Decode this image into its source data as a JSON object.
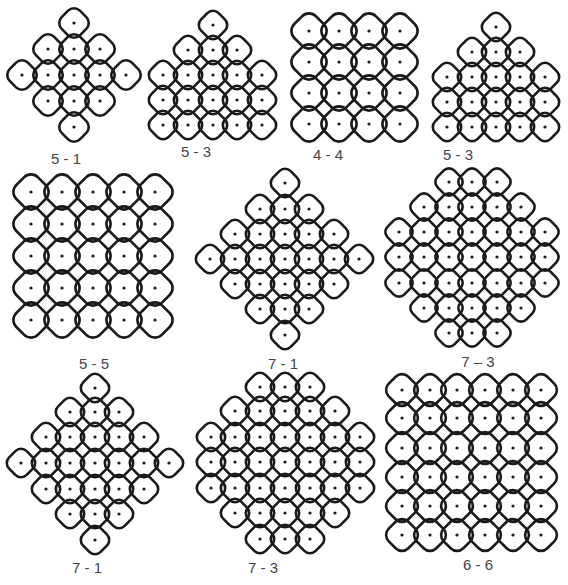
{
  "figure": {
    "background": "#ffffff",
    "stroke_color": "#1a1a1a",
    "dot_color": "#1a1a1a",
    "label_color": "#444444",
    "kolams": [
      {
        "id": "k1",
        "label": "5 - 1",
        "label_pos": [
          66,
          150
        ],
        "spacing": 26,
        "dots": [
          [
            74,
            23
          ],
          [
            48,
            49
          ],
          [
            74,
            49
          ],
          [
            100,
            49
          ],
          [
            22,
            75
          ],
          [
            48,
            75
          ],
          [
            74,
            75
          ],
          [
            100,
            75
          ],
          [
            126,
            75
          ],
          [
            48,
            101
          ],
          [
            74,
            101
          ],
          [
            100,
            101
          ],
          [
            74,
            127
          ]
        ]
      },
      {
        "id": "k2",
        "label": "5 - 3",
        "label_pos": [
          196,
          143
        ],
        "spacing": 25,
        "dots": [
          [
            213,
            25
          ],
          [
            188,
            50
          ],
          [
            213,
            50
          ],
          [
            237,
            50
          ],
          [
            163,
            75
          ],
          [
            188,
            75
          ],
          [
            213,
            75
          ],
          [
            237,
            75
          ],
          [
            262,
            75
          ],
          [
            163,
            100
          ],
          [
            188,
            100
          ],
          [
            213,
            100
          ],
          [
            237,
            100
          ],
          [
            262,
            100
          ],
          [
            163,
            125
          ],
          [
            188,
            125
          ],
          [
            213,
            125
          ],
          [
            237,
            125
          ],
          [
            262,
            125
          ]
        ]
      },
      {
        "id": "k3",
        "label": "4 - 4",
        "label_pos": [
          328,
          146
        ],
        "spacing": 31,
        "dots": [
          [
            309,
            31
          ],
          [
            339,
            31
          ],
          [
            369,
            31
          ],
          [
            400,
            31
          ],
          [
            309,
            62
          ],
          [
            339,
            62
          ],
          [
            369,
            62
          ],
          [
            400,
            62
          ],
          [
            309,
            93
          ],
          [
            339,
            93
          ],
          [
            369,
            93
          ],
          [
            400,
            93
          ],
          [
            309,
            124
          ],
          [
            339,
            124
          ],
          [
            369,
            124
          ],
          [
            400,
            124
          ]
        ]
      },
      {
        "id": "k4",
        "label": "5 - 3",
        "label_pos": [
          458,
          146
        ],
        "spacing": 25,
        "dots": [
          [
            496,
            27
          ],
          [
            472,
            52
          ],
          [
            496,
            52
          ],
          [
            520,
            52
          ],
          [
            447,
            77
          ],
          [
            472,
            77
          ],
          [
            496,
            77
          ],
          [
            520,
            77
          ],
          [
            545,
            77
          ],
          [
            447,
            102
          ],
          [
            472,
            102
          ],
          [
            496,
            102
          ],
          [
            520,
            102
          ],
          [
            545,
            102
          ],
          [
            447,
            127
          ],
          [
            472,
            127
          ],
          [
            496,
            127
          ],
          [
            520,
            127
          ],
          [
            545,
            127
          ]
        ]
      },
      {
        "id": "k5",
        "label": "5 - 5",
        "label_pos": [
          94,
          355
        ],
        "spacing": 31,
        "dots": [
          [
            31,
            192
          ],
          [
            62,
            192
          ],
          [
            93,
            192
          ],
          [
            124,
            192
          ],
          [
            155,
            192
          ],
          [
            31,
            224
          ],
          [
            62,
            224
          ],
          [
            93,
            224
          ],
          [
            124,
            224
          ],
          [
            155,
            224
          ],
          [
            31,
            256
          ],
          [
            62,
            256
          ],
          [
            93,
            256
          ],
          [
            124,
            256
          ],
          [
            155,
            256
          ],
          [
            31,
            288
          ],
          [
            62,
            288
          ],
          [
            93,
            288
          ],
          [
            124,
            288
          ],
          [
            155,
            288
          ],
          [
            31,
            320
          ],
          [
            62,
            320
          ],
          [
            93,
            320
          ],
          [
            124,
            320
          ],
          [
            155,
            320
          ]
        ]
      },
      {
        "id": "k6",
        "label": "7 - 1",
        "label_pos": [
          283,
          355
        ],
        "spacing": 25,
        "dots": [
          [
            285,
            183
          ],
          [
            260,
            209
          ],
          [
            285,
            209
          ],
          [
            309,
            209
          ],
          [
            235,
            234
          ],
          [
            260,
            234
          ],
          [
            285,
            234
          ],
          [
            309,
            234
          ],
          [
            334,
            234
          ],
          [
            210,
            259
          ],
          [
            235,
            259
          ],
          [
            260,
            259
          ],
          [
            285,
            259
          ],
          [
            309,
            259
          ],
          [
            334,
            259
          ],
          [
            359,
            259
          ],
          [
            235,
            284
          ],
          [
            260,
            284
          ],
          [
            285,
            284
          ],
          [
            309,
            284
          ],
          [
            334,
            284
          ],
          [
            260,
            309
          ],
          [
            285,
            309
          ],
          [
            309,
            309
          ],
          [
            285,
            335
          ]
        ]
      },
      {
        "id": "k7",
        "label": "7 – 3",
        "label_pos": [
          478,
          353
        ],
        "spacing": 24,
        "dots": [
          [
            449,
            182
          ],
          [
            472,
            182
          ],
          [
            497,
            182
          ],
          [
            424,
            207
          ],
          [
            449,
            207
          ],
          [
            472,
            207
          ],
          [
            497,
            207
          ],
          [
            521,
            207
          ],
          [
            399,
            232
          ],
          [
            424,
            232
          ],
          [
            449,
            232
          ],
          [
            472,
            232
          ],
          [
            497,
            232
          ],
          [
            521,
            232
          ],
          [
            545,
            232
          ],
          [
            399,
            257
          ],
          [
            424,
            257
          ],
          [
            449,
            257
          ],
          [
            472,
            257
          ],
          [
            497,
            257
          ],
          [
            521,
            257
          ],
          [
            545,
            257
          ],
          [
            399,
            283
          ],
          [
            424,
            283
          ],
          [
            449,
            283
          ],
          [
            472,
            283
          ],
          [
            497,
            283
          ],
          [
            521,
            283
          ],
          [
            545,
            283
          ],
          [
            424,
            308
          ],
          [
            449,
            308
          ],
          [
            472,
            308
          ],
          [
            497,
            308
          ],
          [
            521,
            308
          ],
          [
            449,
            333
          ],
          [
            472,
            333
          ],
          [
            497,
            333
          ]
        ]
      },
      {
        "id": "k8",
        "label": "7 - 1",
        "label_pos": [
          87,
          559
        ],
        "spacing": 25,
        "dots": [
          [
            95,
            388
          ],
          [
            70,
            412
          ],
          [
            95,
            412
          ],
          [
            119,
            412
          ],
          [
            46,
            437
          ],
          [
            70,
            437
          ],
          [
            95,
            437
          ],
          [
            119,
            437
          ],
          [
            144,
            437
          ],
          [
            21,
            463
          ],
          [
            46,
            463
          ],
          [
            70,
            463
          ],
          [
            95,
            463
          ],
          [
            119,
            463
          ],
          [
            144,
            463
          ],
          [
            169,
            463
          ],
          [
            46,
            489
          ],
          [
            70,
            489
          ],
          [
            95,
            489
          ],
          [
            119,
            489
          ],
          [
            144,
            489
          ],
          [
            70,
            514
          ],
          [
            95,
            514
          ],
          [
            119,
            514
          ],
          [
            95,
            540
          ]
        ]
      },
      {
        "id": "k9",
        "label": "7 - 3",
        "label_pos": [
          263,
          559
        ],
        "spacing": 25,
        "dots": [
          [
            260,
            387
          ],
          [
            285,
            387
          ],
          [
            310,
            387
          ],
          [
            235,
            411
          ],
          [
            260,
            411
          ],
          [
            285,
            411
          ],
          [
            310,
            411
          ],
          [
            335,
            411
          ],
          [
            211,
            437
          ],
          [
            235,
            437
          ],
          [
            260,
            437
          ],
          [
            285,
            437
          ],
          [
            310,
            437
          ],
          [
            335,
            437
          ],
          [
            360,
            437
          ],
          [
            211,
            462
          ],
          [
            235,
            462
          ],
          [
            260,
            462
          ],
          [
            285,
            462
          ],
          [
            310,
            462
          ],
          [
            335,
            462
          ],
          [
            360,
            462
          ],
          [
            211,
            488
          ],
          [
            235,
            488
          ],
          [
            260,
            488
          ],
          [
            285,
            488
          ],
          [
            310,
            488
          ],
          [
            335,
            488
          ],
          [
            360,
            488
          ],
          [
            235,
            513
          ],
          [
            260,
            513
          ],
          [
            285,
            513
          ],
          [
            310,
            513
          ],
          [
            335,
            513
          ],
          [
            260,
            539
          ],
          [
            285,
            539
          ],
          [
            310,
            539
          ]
        ]
      },
      {
        "id": "k10",
        "label": "6 - 6",
        "label_pos": [
          478,
          556
        ],
        "spacing": 28,
        "dots": [
          [
            402,
            390
          ],
          [
            430,
            390
          ],
          [
            457,
            390
          ],
          [
            485,
            390
          ],
          [
            513,
            390
          ],
          [
            541,
            390
          ],
          [
            402,
            418
          ],
          [
            430,
            418
          ],
          [
            457,
            418
          ],
          [
            485,
            418
          ],
          [
            513,
            418
          ],
          [
            541,
            418
          ],
          [
            402,
            448
          ],
          [
            430,
            448
          ],
          [
            457,
            448
          ],
          [
            485,
            448
          ],
          [
            513,
            448
          ],
          [
            541,
            448
          ],
          [
            402,
            477
          ],
          [
            430,
            477
          ],
          [
            457,
            477
          ],
          [
            485,
            477
          ],
          [
            513,
            477
          ],
          [
            541,
            477
          ],
          [
            402,
            506
          ],
          [
            430,
            506
          ],
          [
            457,
            506
          ],
          [
            485,
            506
          ],
          [
            513,
            506
          ],
          [
            541,
            506
          ],
          [
            402,
            535
          ],
          [
            430,
            535
          ],
          [
            457,
            535
          ],
          [
            485,
            535
          ],
          [
            513,
            535
          ],
          [
            541,
            535
          ]
        ]
      }
    ]
  }
}
